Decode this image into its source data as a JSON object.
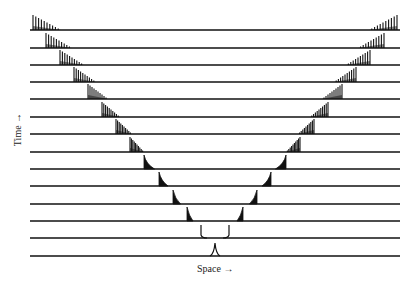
{
  "figure": {
    "x_axis_label": "Space →",
    "y_axis_label": "Time →",
    "ink_color": "#111111",
    "background": "#ffffff"
  },
  "chart_data": {
    "type": "spacetime-wave-diagram",
    "line_x_start": 30,
    "line_x_end": 400,
    "center_x": 215,
    "rows": [
      {
        "t": 0,
        "y": 256,
        "front_offset": 0,
        "form": "spike"
      },
      {
        "t": 1,
        "y": 238,
        "front_offset": 14,
        "form": "cusp"
      },
      {
        "t": 2,
        "y": 221,
        "front_offset": 28,
        "form": "wedge"
      },
      {
        "t": 3,
        "y": 204,
        "front_offset": 42,
        "form": "wedge"
      },
      {
        "t": 4,
        "y": 186,
        "front_offset": 56,
        "form": "wedge"
      },
      {
        "t": 5,
        "y": 169,
        "front_offset": 71,
        "form": "wedge"
      },
      {
        "t": 6,
        "y": 152,
        "front_offset": 85,
        "form": "comb"
      },
      {
        "t": 7,
        "y": 134,
        "front_offset": 99,
        "form": "comb"
      },
      {
        "t": 8,
        "y": 117,
        "front_offset": 113,
        "form": "comb"
      },
      {
        "t": 9,
        "y": 99,
        "front_offset": 127,
        "form": "comb"
      },
      {
        "t": 10,
        "y": 82,
        "front_offset": 141,
        "form": "comb"
      },
      {
        "t": 11,
        "y": 65,
        "front_offset": 155,
        "form": "comb"
      },
      {
        "t": 12,
        "y": 48,
        "front_offset": 169,
        "form": "comb"
      },
      {
        "t": 13,
        "y": 30,
        "front_offset": 182,
        "form": "comb"
      }
    ]
  }
}
